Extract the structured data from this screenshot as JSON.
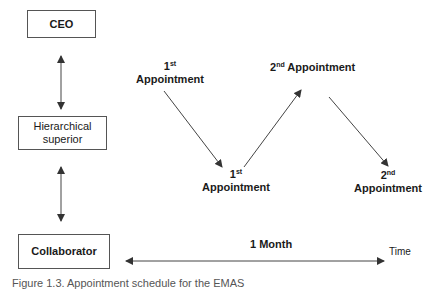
{
  "hierarchy": {
    "top": {
      "label": "CEO"
    },
    "middle": {
      "label_line1": "Hierarchical",
      "label_line2": "superior"
    },
    "bottom": {
      "label": "Collaborator"
    }
  },
  "appointments": [
    {
      "ordinal": "1",
      "suffix": "st",
      "text": "Appointment",
      "position": "upper-left"
    },
    {
      "ordinal": "1",
      "suffix": "st",
      "text": "Appointment",
      "position": "lower-left"
    },
    {
      "ordinal": "2",
      "suffix": "nd",
      "text": "Appointment",
      "position": "upper-right"
    },
    {
      "ordinal": "2",
      "suffix": "nd",
      "text": "Appointment",
      "position": "lower-right"
    }
  ],
  "timeline": {
    "duration_label": "1 Month",
    "axis_label": "Time"
  },
  "caption": {
    "text": "Figure 1.3. Appointment schedule for the EMAS"
  },
  "colors": {
    "line": "#444444",
    "box_border": "#555555",
    "text": "#1a1a1a"
  }
}
